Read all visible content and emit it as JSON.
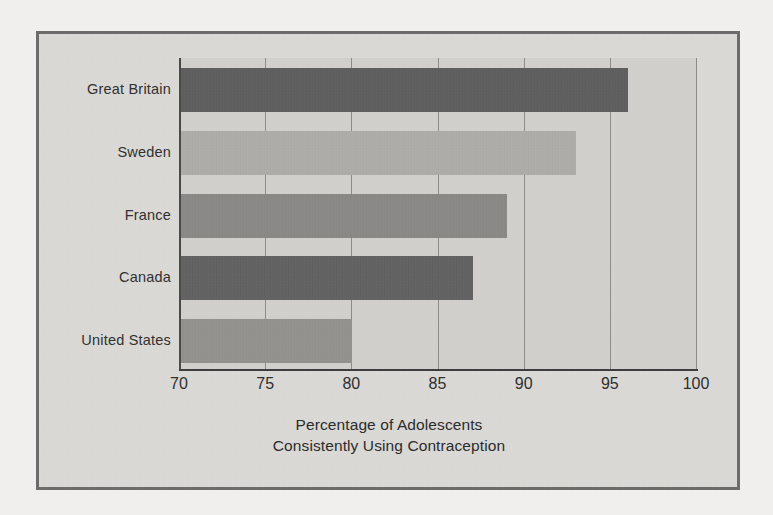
{
  "figure": {
    "frame_color": "#6c6c6c",
    "background_color": "#dbdad7",
    "plot_background_color": "#d2d1ce"
  },
  "chart_data": {
    "type": "bar",
    "orientation": "horizontal",
    "title": "",
    "subtitle": "",
    "xlabel": "Percentage of Adolescents Consistently Using Contraception",
    "ylabel": "",
    "categories": [
      "Great Britain",
      "Sweden",
      "France",
      "Canada",
      "United States"
    ],
    "values": [
      96,
      93,
      89,
      87,
      80
    ],
    "xlim": [
      70,
      100
    ],
    "xticks": [
      70,
      75,
      80,
      85,
      90,
      95,
      100
    ],
    "xticklabels": [
      "70",
      "75",
      "80",
      "85",
      "90",
      "95",
      "100"
    ],
    "grid": "vertical",
    "legend": "none",
    "bar_colors": [
      "#5b5b5b",
      "#b2b1ad",
      "#8b8a87",
      "#5f5f5f",
      "#949390"
    ]
  },
  "caption": {
    "line1": "Percentage of Adolescents",
    "line2": "Consistently Using Contraception"
  }
}
